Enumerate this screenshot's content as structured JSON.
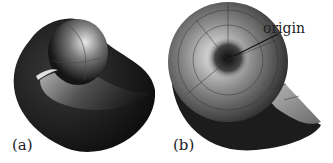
{
  "figure": {
    "panels": [
      {
        "id": "a",
        "label": "(a)",
        "description": "shaded 3D spiral shell surface, side view"
      },
      {
        "id": "b",
        "label": "(b)",
        "description": "shaded 3D spiral shell surface with wireframe grid, front view"
      }
    ],
    "annotations": [
      {
        "panel": "b",
        "text": "origin"
      }
    ],
    "colors": {
      "surface_dark": "#1a1a1a",
      "surface_light": "#d8d8d8",
      "background": "#ffffff"
    }
  }
}
